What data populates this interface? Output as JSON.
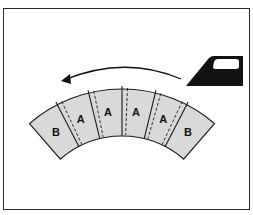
{
  "diagram": {
    "arc": {
      "center": [
        122,
        230
      ],
      "outer_radius": 141,
      "inner_radius": 94,
      "start_angle_deg": -41,
      "end_angle_deg": 41,
      "fill": "#d9d9d9",
      "stroke": "#1a1a1a"
    },
    "segments": [
      {
        "label": "B"
      },
      {
        "label": "A"
      },
      {
        "label": "A"
      },
      {
        "label": "A"
      },
      {
        "label": "A"
      },
      {
        "label": "B"
      }
    ],
    "seam_allowance_side": [
      "right",
      "right",
      "right",
      "right",
      "left"
    ],
    "arrow": {
      "direction": "right-to-left",
      "color": "#111111"
    },
    "iron_icon": {
      "color": "#111111"
    }
  }
}
